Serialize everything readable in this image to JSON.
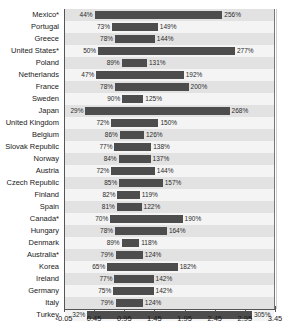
{
  "chart_title_sliver": "Unemployment benefit replacement rates",
  "axis": {
    "ticks": [
      "-0.05",
      "0.45",
      "0.95",
      "1.45",
      "1.95",
      "2.45",
      "2.95",
      "3.45"
    ],
    "tick_values": [
      -0.05,
      0.45,
      0.95,
      1.45,
      1.95,
      2.45,
      2.95,
      3.45
    ],
    "min": -0.05,
    "max": 3.45
  },
  "colors": {
    "bar": "#4d4d4d",
    "band": "#e2e2e2",
    "plain": "#f4f4f4",
    "grid": "#cfcfcf",
    "axis": "#555555",
    "text": "#1a1a1a"
  },
  "chart_data": {
    "type": "bar",
    "orientation": "horizontal",
    "title": "",
    "xlabel": "",
    "ylabel": "",
    "xlim": [
      -0.05,
      3.45
    ],
    "grid": true,
    "legend": "none",
    "note": "Floating (range) bars: each country bar spans from a low value to a high value, both labeled as percentages.",
    "categories": [
      "Mexico*",
      "Portugal",
      "Greece",
      "United States*",
      "Poland",
      "Netherlands",
      "France",
      "Sweden",
      "Japan",
      "United Kingdom",
      "Belgium",
      "Slovak Republic",
      "Norway",
      "Austria",
      "Czech Republic",
      "Finland",
      "Spain",
      "Canada*",
      "Hungary",
      "Denmark",
      "Australia*",
      "Korea",
      "Ireland",
      "Germany",
      "Italy",
      "Turkey"
    ],
    "series": [
      {
        "name": "low",
        "values": [
          44,
          73,
          78,
          50,
          89,
          47,
          78,
          90,
          29,
          72,
          86,
          77,
          84,
          72,
          85,
          82,
          81,
          70,
          78,
          89,
          79,
          65,
          77,
          75,
          79,
          32
        ],
        "labels": [
          "44%",
          "73%",
          "78%",
          "50%",
          "89%",
          "47%",
          "78%",
          "90%",
          "29%",
          "72%",
          "86%",
          "77%",
          "84%",
          "72%",
          "85%",
          "82%",
          "81%",
          "70%",
          "78%",
          "89%",
          "79%",
          "65%",
          "77%",
          "75%",
          "79%",
          "32%"
        ]
      },
      {
        "name": "high",
        "values": [
          256,
          149,
          144,
          277,
          131,
          192,
          200,
          125,
          268,
          150,
          126,
          138,
          137,
          144,
          157,
          119,
          122,
          190,
          164,
          118,
          124,
          182,
          142,
          142,
          124,
          305
        ],
        "labels": [
          "256%",
          "149%",
          "144%",
          "277%",
          "131%",
          "192%",
          "200%",
          "125%",
          "268%",
          "150%",
          "126%",
          "138%",
          "137%",
          "144%",
          "157%",
          "119%",
          "122%",
          "190%",
          "164%",
          "118%",
          "124%",
          "182%",
          "142%",
          "142%",
          "124%",
          "305%"
        ]
      }
    ]
  }
}
